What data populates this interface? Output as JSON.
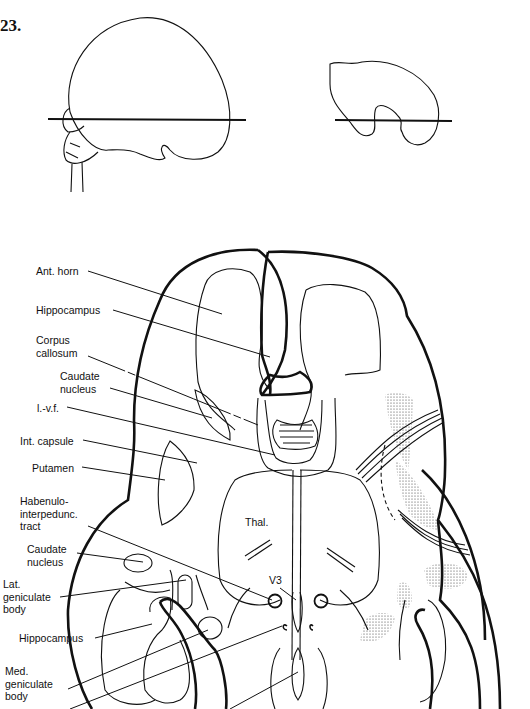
{
  "figure": {
    "number": "23."
  },
  "labels": {
    "ant_horn": "Ant. horn",
    "hippocampus_top": "Hippocampus",
    "corpus_callosum": "Corpus\ncallosum",
    "caudate_nucleus_top": "Caudate\nnucleus",
    "lvf": "l.-v.f.",
    "int_capsule": "Int. capsule",
    "putamen": "Putamen",
    "habenulo_tract": "Habenulo-\ninterpedunc.\ntract",
    "caudate_nucleus_bottom": "Caudate\nnucleus",
    "lat_geniculate": "Lat.\ngeniculate\nbody",
    "hippocampus_bottom": "Hippocampus",
    "med_geniculate": "Med.\ngeniculate\nbody",
    "thalamus": "Thal.",
    "v3": "V3"
  },
  "colors": {
    "ink": "#111111",
    "background": "#ffffff"
  }
}
